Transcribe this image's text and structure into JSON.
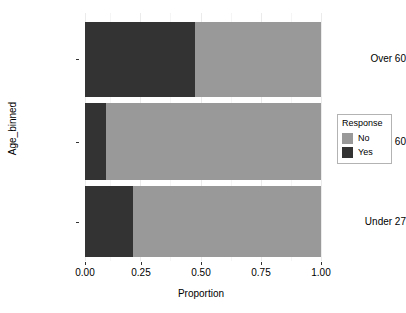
{
  "chart_data": {
    "type": "bar",
    "orientation": "horizontal",
    "stacked": true,
    "title": "",
    "xlabel": "Proportion",
    "ylabel": "Age_binned",
    "categories": [
      "Over 60",
      "27 to 60",
      "Under 27"
    ],
    "series": [
      {
        "name": "No",
        "color": "#999999",
        "values": [
          0.535,
          0.912,
          0.797
        ]
      },
      {
        "name": "Yes",
        "color": "#333333",
        "values": [
          0.465,
          0.088,
          0.203
        ]
      }
    ],
    "stack_order_left_to_right": [
      "Yes",
      "No"
    ],
    "xlim": [
      0,
      1
    ],
    "xticks": [
      0,
      0.25,
      0.5,
      0.75,
      1
    ],
    "xtick_labels": [
      "0.00",
      "0.25",
      "0.50",
      "0.75",
      "1.00"
    ],
    "grid": true,
    "grid_axis": "x",
    "legend": {
      "title": "Response",
      "position": "right",
      "entries": [
        "No",
        "Yes"
      ]
    },
    "panel_background": "#ffffff",
    "gridline_color": "#ebebeb"
  },
  "axes": {
    "y": {
      "title": "Age_binned",
      "tick_labels": [
        "Over 60",
        "27 to 60",
        "Under 27"
      ]
    },
    "x": {
      "title": "Proportion",
      "tick_labels": [
        "0.00",
        "0.25",
        "0.50",
        "0.75",
        "1.00"
      ]
    }
  },
  "legend": {
    "title": "Response",
    "items": [
      {
        "label": "No",
        "color": "#999999"
      },
      {
        "label": "Yes",
        "color": "#333333"
      }
    ]
  }
}
